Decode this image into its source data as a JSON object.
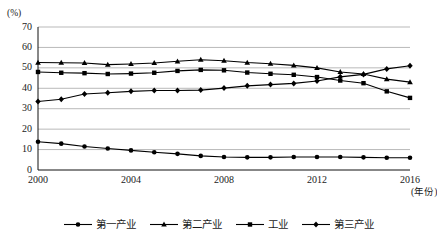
{
  "chart_data": {
    "type": "line",
    "title": "",
    "xlabel": "年份",
    "ylabel": "%",
    "y_unit_label": "(%)",
    "x_unit_label": "(年份)",
    "grid": true,
    "legend_position": "bottom",
    "xlim": [
      2000,
      2016
    ],
    "ylim": [
      0,
      70
    ],
    "ytick_step": 10,
    "yticks": [
      0,
      10,
      20,
      30,
      40,
      50,
      60,
      70
    ],
    "xticks": [
      2000,
      2004,
      2008,
      2012,
      2016
    ],
    "x": [
      2000,
      2001,
      2002,
      2003,
      2004,
      2005,
      2006,
      2007,
      2008,
      2009,
      2010,
      2011,
      2012,
      2013,
      2014,
      2015,
      2016
    ],
    "series": [
      {
        "name": "第一产业",
        "marker": "circle",
        "color": "#000000",
        "values": [
          13.8,
          12.9,
          11.5,
          10.5,
          9.6,
          8.7,
          7.9,
          6.9,
          6.4,
          6.2,
          6.2,
          6.4,
          6.4,
          6.4,
          6.2,
          6.0,
          6.0
        ]
      },
      {
        "name": "第二产业",
        "marker": "triangle",
        "color": "#000000",
        "values": [
          52.6,
          52.5,
          52.4,
          51.6,
          51.9,
          52.4,
          53.2,
          54.0,
          53.5,
          52.6,
          52.0,
          51.2,
          50.0,
          48.0,
          47.0,
          44.5,
          43.0
        ]
      },
      {
        "name": "工业",
        "marker": "square",
        "color": "#000000",
        "values": [
          48.0,
          47.6,
          47.4,
          47.0,
          47.2,
          47.6,
          48.5,
          49.0,
          48.8,
          47.7,
          47.1,
          46.6,
          45.5,
          43.8,
          42.5,
          38.5,
          35.3
        ]
      },
      {
        "name": "第三产业",
        "marker": "diamond",
        "color": "#000000",
        "values": [
          33.5,
          34.6,
          37.2,
          37.8,
          38.5,
          38.9,
          38.9,
          39.1,
          40.1,
          41.2,
          41.8,
          42.4,
          43.6,
          45.6,
          46.8,
          49.5,
          51.0
        ]
      }
    ]
  },
  "legend": {
    "items": [
      {
        "label": "第一产业",
        "marker": "circle"
      },
      {
        "label": "第二产业",
        "marker": "triangle"
      },
      {
        "label": "工业",
        "marker": "square"
      },
      {
        "label": "第三产业",
        "marker": "diamond"
      }
    ]
  }
}
